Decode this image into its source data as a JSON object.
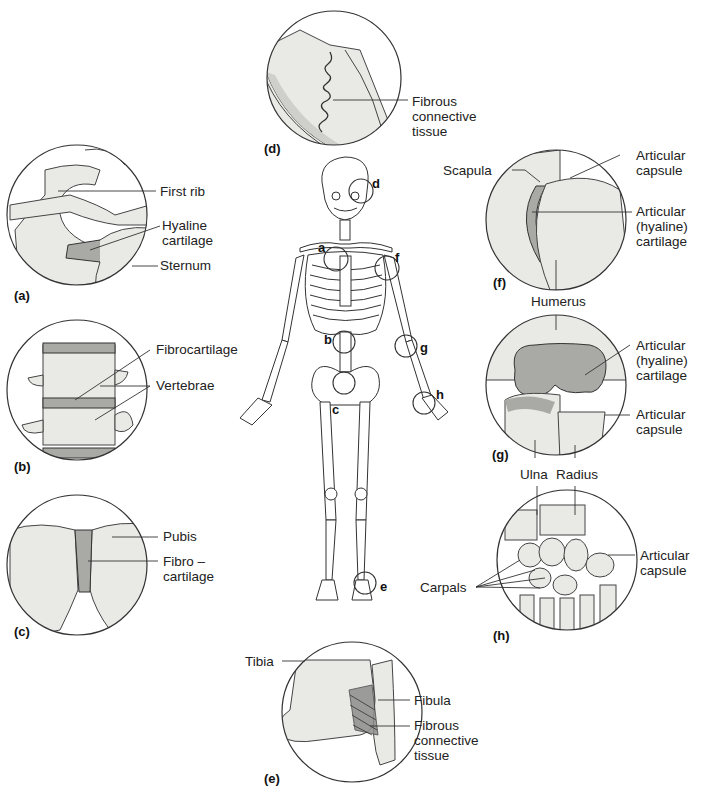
{
  "figure": {
    "colors": {
      "bone_fill": "#e9e9e6",
      "cartilage_fill": "#a9a9a6",
      "outline": "#3a3a3a",
      "background": "#ffffff"
    },
    "skeleton_markers": [
      {
        "id": "a",
        "label": "a"
      },
      {
        "id": "b",
        "label": "b"
      },
      {
        "id": "c",
        "label": "c"
      },
      {
        "id": "d",
        "label": "d"
      },
      {
        "id": "e",
        "label": "e"
      },
      {
        "id": "f",
        "label": "f"
      },
      {
        "id": "g",
        "label": "g"
      },
      {
        "id": "h",
        "label": "h"
      }
    ],
    "panels": {
      "a": {
        "id_label": "(a)",
        "labels": [
          "First rib",
          "Hyaline\ncartilage",
          "Sternum"
        ]
      },
      "b": {
        "id_label": "(b)",
        "labels": [
          "Fibrocartilage",
          "Vertebrae"
        ]
      },
      "c": {
        "id_label": "(c)",
        "labels": [
          "Pubis",
          "Fibro –\ncartilage"
        ]
      },
      "d": {
        "id_label": "(d)",
        "labels": [
          "Fibrous\nconnective\ntissue"
        ]
      },
      "e": {
        "id_label": "(e)",
        "labels": [
          "Tibia",
          "Fibula",
          "Fibrous\nconnective\ntissue"
        ]
      },
      "f": {
        "id_label": "(f)",
        "labels": [
          "Scapula",
          "Articular\ncapsule",
          "Articular\n(hyaline)\ncartilage",
          "Humerus"
        ]
      },
      "g": {
        "id_label": "(g)",
        "labels": [
          "Articular\n(hyaline)\ncartilage",
          "Articular\ncapsule",
          "Ulna",
          "Radius"
        ]
      },
      "h": {
        "id_label": "(h)",
        "labels": [
          "Articular\ncapsule",
          "Carpals"
        ]
      }
    }
  }
}
